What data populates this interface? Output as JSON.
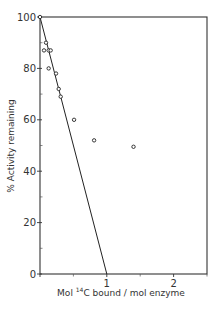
{
  "chart_data": {
    "type": "scatter",
    "title": "",
    "xlabel": "Mol 14C bound / mol enzyme",
    "xlabel_parts": {
      "prefix": "Mol ",
      "superscript": "14",
      "suffix": "C bound / mol enzyme"
    },
    "ylabel": "% Activity remaining",
    "xlim": [
      0,
      2.5
    ],
    "ylim": [
      0,
      100
    ],
    "x_ticks_major": [
      0,
      1,
      2
    ],
    "x_tick_labels": [
      "",
      "1",
      "2"
    ],
    "x_ticks_minor": [
      0.5,
      1.5,
      2.5
    ],
    "y_ticks_major": [
      0,
      20,
      40,
      60,
      80,
      100
    ],
    "y_tick_labels": [
      "0",
      "20",
      "40",
      "60",
      "80",
      "100"
    ],
    "y_ticks_minor": [
      10,
      30,
      50,
      70,
      90
    ],
    "grid": false,
    "legend": null,
    "series": [
      {
        "name": "data",
        "marker": "open-circle",
        "points": [
          {
            "x": 0.0,
            "y": 100
          },
          {
            "x": 0.09,
            "y": 90
          },
          {
            "x": 0.06,
            "y": 87
          },
          {
            "x": 0.13,
            "y": 87
          },
          {
            "x": 0.16,
            "y": 87
          },
          {
            "x": 0.13,
            "y": 80
          },
          {
            "x": 0.24,
            "y": 78
          },
          {
            "x": 0.28,
            "y": 72
          },
          {
            "x": 0.31,
            "y": 69
          },
          {
            "x": 0.51,
            "y": 60
          },
          {
            "x": 0.81,
            "y": 52
          },
          {
            "x": 1.4,
            "y": 49.5
          }
        ]
      }
    ],
    "fit_line": {
      "name": "theoretical line",
      "x": [
        0,
        1
      ],
      "y": [
        100,
        0
      ]
    }
  }
}
